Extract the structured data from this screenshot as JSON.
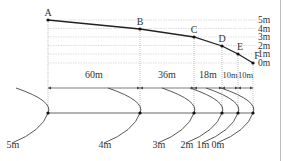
{
  "diagram": {
    "colors": {
      "profile_line": "#222222",
      "grid_line": "#c8c8c8",
      "text": "#333333",
      "arc": "#444444",
      "border": "#bdbdbd"
    },
    "points": [
      {
        "label": "A",
        "x": 48,
        "y": 20
      },
      {
        "label": "B",
        "x": 140,
        "y": 29
      },
      {
        "label": "C",
        "x": 194,
        "y": 37
      },
      {
        "label": "D",
        "x": 222,
        "y": 46
      },
      {
        "label": "E",
        "x": 238,
        "y": 54
      },
      {
        "label": "F",
        "x": 253,
        "y": 63
      }
    ],
    "height_levels": [
      {
        "label": "5m",
        "y": 20
      },
      {
        "label": "4m",
        "y": 28.5
      },
      {
        "label": "3m",
        "y": 37
      },
      {
        "label": "2m",
        "y": 45.5
      },
      {
        "label": "1m",
        "y": 54
      },
      {
        "label": "0m",
        "y": 63
      }
    ],
    "distances": [
      {
        "label": "60m",
        "from": 48,
        "to": 140
      },
      {
        "label": "36m",
        "from": 140,
        "to": 194
      },
      {
        "label": "18m",
        "from": 194,
        "to": 222
      },
      {
        "label": "10m",
        "from": 222,
        "to": 238
      },
      {
        "label": "10m",
        "from": 238,
        "to": 253
      }
    ],
    "contours": [
      {
        "label": "5m",
        "x": 48
      },
      {
        "label": "4m",
        "x": 140
      },
      {
        "label": "3m",
        "x": 194
      },
      {
        "label": "2m",
        "x": 222
      },
      {
        "label": "1m",
        "x": 238
      },
      {
        "label": "0m",
        "x": 253
      }
    ]
  }
}
